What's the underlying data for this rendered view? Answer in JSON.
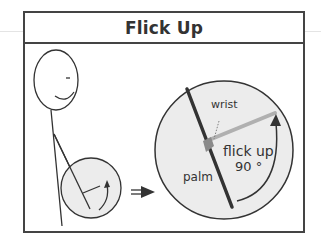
{
  "title": "Flick Up",
  "labels": {
    "wrist": "wrist",
    "palm": "palm",
    "gesture": "flick up",
    "angle": "90 °"
  },
  "colors": {
    "frame": "#444444",
    "circle_fill": "#ececec",
    "arm_dark": "#333333",
    "hand_light": "#b0b0b0",
    "wrist_joint": "#8a8a8a"
  }
}
